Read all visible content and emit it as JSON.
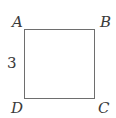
{
  "diagram": {
    "shape": "square",
    "vertices": {
      "top_left": "A",
      "top_right": "B",
      "bottom_right": "C",
      "bottom_left": "D"
    },
    "side_label": "3",
    "colors": {
      "stroke": "#6e6e6e",
      "text": "#3a3a3a"
    }
  }
}
